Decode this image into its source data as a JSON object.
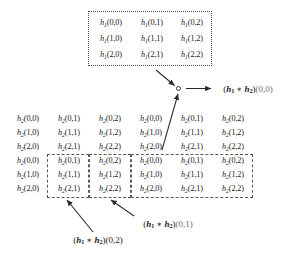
{
  "figure": {
    "symbols": {
      "h1": "h",
      "h1_sub": "1",
      "h2": "h",
      "h2_sub": "2",
      "conv_star": "∗"
    },
    "colors": {
      "text": "#1a1a1a",
      "box_border": "#5a5a5a",
      "arrow": "#2b2b2b",
      "background": "#ffffff"
    }
  },
  "h1_matrix": {
    "name": "h1",
    "rows": 3,
    "cols": 3,
    "cells": [
      [
        {
          "base": "h",
          "sub": "1",
          "idx": "(0,0)"
        },
        {
          "base": "h",
          "sub": "1",
          "idx": "(0,1)"
        },
        {
          "base": "h",
          "sub": "1",
          "idx": "(0,2)"
        }
      ],
      [
        {
          "base": "h",
          "sub": "1",
          "idx": "(1,0)"
        },
        {
          "base": "h",
          "sub": "1",
          "idx": "(1,1)"
        },
        {
          "base": "h",
          "sub": "1",
          "idx": "(1,2)"
        }
      ],
      [
        {
          "base": "h",
          "sub": "1",
          "idx": "(2,0)"
        },
        {
          "base": "h",
          "sub": "1",
          "idx": "(2,1)"
        },
        {
          "base": "h",
          "sub": "1",
          "idx": "(2,2)"
        }
      ]
    ]
  },
  "h2_grid": {
    "name": "h2",
    "rows": 6,
    "cols": 6,
    "cells": [
      [
        {
          "base": "h",
          "sub": "2",
          "idx": "(0,0)"
        },
        {
          "base": "h",
          "sub": "2",
          "idx": "(0,1)"
        },
        {
          "base": "h",
          "sub": "2",
          "idx": "(0,2)"
        },
        {
          "base": "h",
          "sub": "2",
          "idx": "(0,0)"
        },
        {
          "base": "h",
          "sub": "2",
          "idx": "(0,1)"
        },
        {
          "base": "h",
          "sub": "2",
          "idx": "(0,2)"
        }
      ],
      [
        {
          "base": "h",
          "sub": "2",
          "idx": "(1,0)"
        },
        {
          "base": "h",
          "sub": "2",
          "idx": "(1,1)"
        },
        {
          "base": "h",
          "sub": "2",
          "idx": "(1,2)"
        },
        {
          "base": "h",
          "sub": "2",
          "idx": "(1,0)"
        },
        {
          "base": "h",
          "sub": "2",
          "idx": "(1,1)"
        },
        {
          "base": "h",
          "sub": "2",
          "idx": "(1,2)"
        }
      ],
      [
        {
          "base": "h",
          "sub": "2",
          "idx": "(2,0)"
        },
        {
          "base": "h",
          "sub": "2",
          "idx": "(2,1)"
        },
        {
          "base": "h",
          "sub": "2",
          "idx": "(2,2)"
        },
        {
          "base": "h",
          "sub": "2",
          "idx": "(2,0)"
        },
        {
          "base": "h",
          "sub": "2",
          "idx": "(2,1)"
        },
        {
          "base": "h",
          "sub": "2",
          "idx": "(2,2)"
        }
      ],
      [
        {
          "base": "h",
          "sub": "2",
          "idx": "(0,0)"
        },
        {
          "base": "h",
          "sub": "2",
          "idx": "(0,1)"
        },
        {
          "base": "h",
          "sub": "2",
          "idx": "(0,2)"
        },
        {
          "base": "h",
          "sub": "2",
          "idx": "(0,0)"
        },
        {
          "base": "h",
          "sub": "2",
          "idx": "(0,1)"
        },
        {
          "base": "h",
          "sub": "2",
          "idx": "(0,2)"
        }
      ],
      [
        {
          "base": "h",
          "sub": "2",
          "idx": "(1,0)"
        },
        {
          "base": "h",
          "sub": "2",
          "idx": "(1,1)"
        },
        {
          "base": "h",
          "sub": "2",
          "idx": "(1,2)"
        },
        {
          "base": "h",
          "sub": "2",
          "idx": "(1,0)"
        },
        {
          "base": "h",
          "sub": "2",
          "idx": "(1,1)"
        },
        {
          "base": "h",
          "sub": "2",
          "idx": "(1,2)"
        }
      ],
      [
        {
          "base": "h",
          "sub": "2",
          "idx": "(2,0)"
        },
        {
          "base": "h",
          "sub": "2",
          "idx": "(2,1)"
        },
        {
          "base": "h",
          "sub": "2",
          "idx": "(2,2)"
        },
        {
          "base": "h",
          "sub": "2",
          "idx": "(2,0)"
        },
        {
          "base": "h",
          "sub": "2",
          "idx": "(2,1)"
        },
        {
          "base": "h",
          "sub": "2",
          "idx": "(2,2)"
        }
      ]
    ]
  },
  "labels": {
    "result_00": {
      "lhs": "h",
      "lhs_sub": "1",
      "rhs": "h",
      "rhs_sub": "2",
      "coord": "(0,0)"
    },
    "result_01": {
      "lhs": "h",
      "lhs_sub": "1",
      "rhs": "h",
      "rhs_sub": "2",
      "coord": "(0,1)"
    },
    "result_02": {
      "lhs": "h",
      "lhs_sub": "1",
      "rhs": "h",
      "rhs_sub": "2",
      "coord": "(0,2)"
    }
  }
}
